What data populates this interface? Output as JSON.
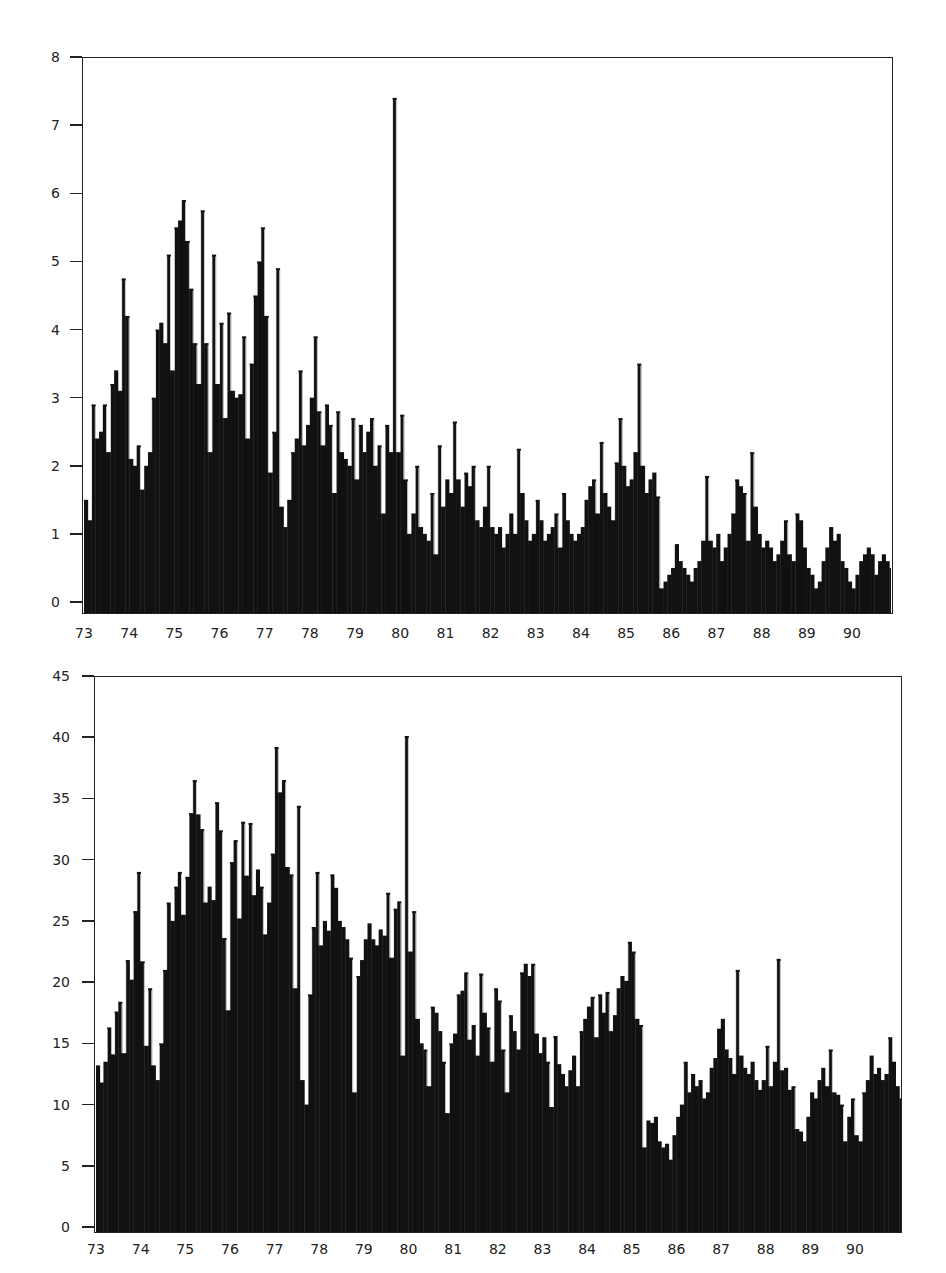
{
  "chart_data": [
    {
      "type": "bar",
      "title": "",
      "xlabel": "",
      "ylabel": "",
      "ylim": [
        0,
        8
      ],
      "xlim": [
        73,
        90.9
      ],
      "yticks": [
        "0",
        "1",
        "2",
        "3",
        "4",
        "5",
        "6",
        "7",
        "8"
      ],
      "xticks": [
        "73",
        "74",
        "75",
        "76",
        "77",
        "78",
        "79",
        "80",
        "81",
        "82",
        "83",
        "84",
        "85",
        "86",
        "87",
        "88",
        "89",
        "90"
      ],
      "grid": false,
      "legend": null,
      "bar_color": "#111111",
      "x_start": 73.0,
      "x_step": 0.0833,
      "values": [
        1.5,
        1.2,
        2.9,
        2.4,
        2.5,
        2.9,
        2.2,
        3.2,
        3.4,
        3.1,
        4.75,
        4.2,
        2.1,
        2.0,
        2.3,
        1.65,
        2.0,
        2.2,
        3.0,
        4.0,
        4.1,
        3.8,
        5.1,
        3.4,
        5.5,
        5.6,
        5.9,
        5.3,
        4.6,
        3.8,
        3.2,
        5.75,
        3.8,
        2.2,
        5.1,
        3.2,
        4.1,
        2.7,
        4.25,
        3.1,
        3.0,
        3.05,
        3.9,
        2.4,
        3.5,
        4.5,
        5.0,
        5.5,
        4.2,
        1.9,
        2.5,
        4.9,
        1.4,
        1.1,
        1.5,
        2.2,
        2.4,
        3.4,
        2.3,
        2.6,
        3.0,
        3.9,
        2.8,
        2.3,
        2.9,
        2.6,
        1.6,
        2.8,
        2.2,
        2.1,
        2.0,
        2.7,
        1.8,
        2.6,
        2.2,
        2.5,
        2.7,
        2.0,
        2.3,
        1.3,
        2.6,
        2.2,
        7.4,
        2.2,
        2.75,
        1.8,
        1.0,
        1.3,
        2.0,
        1.1,
        1.0,
        0.9,
        1.6,
        0.7,
        2.3,
        1.4,
        1.8,
        1.6,
        2.65,
        1.8,
        1.4,
        1.9,
        1.7,
        2.0,
        1.2,
        1.1,
        1.4,
        2.0,
        1.1,
        1.0,
        1.1,
        0.8,
        1.0,
        1.3,
        1.0,
        2.25,
        1.6,
        1.2,
        0.9,
        1.0,
        1.5,
        1.2,
        0.9,
        1.0,
        1.1,
        1.3,
        0.8,
        1.6,
        1.2,
        1.0,
        0.9,
        1.0,
        1.1,
        1.5,
        1.7,
        1.8,
        1.3,
        2.35,
        1.6,
        1.4,
        1.2,
        2.05,
        2.7,
        2.0,
        1.7,
        1.8,
        2.2,
        3.5,
        2.0,
        1.6,
        1.8,
        1.9,
        1.55,
        0.2,
        0.3,
        0.4,
        0.5,
        0.85,
        0.6,
        0.5,
        0.4,
        0.3,
        0.5,
        0.6,
        0.9,
        1.85,
        0.9,
        0.8,
        1.0,
        0.6,
        0.8,
        1.0,
        1.3,
        1.8,
        1.7,
        1.6,
        0.9,
        2.2,
        1.4,
        1.0,
        0.8,
        0.9,
        0.8,
        0.6,
        0.7,
        0.9,
        1.2,
        0.7,
        0.6,
        1.3,
        1.2,
        0.8,
        0.5,
        0.4,
        0.2,
        0.3,
        0.6,
        0.8,
        1.1,
        0.9,
        1.0,
        0.6,
        0.5,
        0.3,
        0.2,
        0.4,
        0.6,
        0.7,
        0.8,
        0.7,
        0.4,
        0.6,
        0.7,
        0.6,
        0.5,
        1.1,
        0.9,
        0.8,
        1.0,
        1.3,
        1.2,
        1.5,
        1.6,
        1.4,
        1.7,
        2.1,
        1.3,
        1.5,
        0.5,
        3.65,
        1.3,
        1.1,
        0.7,
        1.4,
        1.6,
        0.9,
        2.4,
        1.0,
        0.9,
        1.6,
        1.1,
        1.0,
        2.85,
        0.5,
        1.2,
        1.7,
        1.5,
        1.4,
        1.2,
        1.9,
        1.3,
        1.5,
        1.4,
        2.3,
        2.0,
        2.1,
        1.8,
        4.6,
        1.2
      ]
    },
    {
      "type": "bar",
      "title": "",
      "xlabel": "",
      "ylabel": "",
      "ylim": [
        0,
        45
      ],
      "xlim": [
        73,
        91.0
      ],
      "yticks": [
        "0",
        "5",
        "10",
        "15",
        "20",
        "25",
        "30",
        "35",
        "40",
        "45"
      ],
      "xticks": [
        "73",
        "74",
        "75",
        "76",
        "77",
        "78",
        "79",
        "80",
        "81",
        "82",
        "83",
        "84",
        "85",
        "86",
        "87",
        "88",
        "89",
        "90"
      ],
      "grid": false,
      "legend": null,
      "bar_color": "#111111",
      "x_start": 73.0,
      "x_step": 0.0833,
      "values": [
        13.2,
        11.8,
        13.5,
        16.3,
        14.1,
        17.6,
        18.4,
        14.2,
        21.8,
        20.2,
        25.8,
        29.0,
        21.7,
        14.8,
        19.5,
        13.2,
        12.0,
        15.0,
        21.0,
        26.5,
        25.0,
        27.8,
        29.0,
        25.5,
        28.6,
        33.8,
        36.5,
        33.7,
        32.5,
        26.5,
        27.8,
        26.7,
        34.7,
        32.4,
        23.6,
        17.7,
        29.8,
        31.6,
        25.2,
        33.1,
        28.7,
        33.0,
        27.1,
        29.2,
        27.8,
        23.9,
        26.5,
        30.5,
        39.2,
        35.5,
        36.5,
        29.4,
        28.8,
        19.5,
        34.4,
        12.0,
        10.0,
        19.0,
        24.5,
        29.0,
        23.0,
        25.0,
        24.2,
        28.8,
        27.7,
        25.0,
        24.5,
        23.5,
        22.0,
        11.0,
        20.5,
        21.8,
        23.5,
        24.8,
        23.5,
        23.0,
        24.3,
        23.8,
        27.3,
        22.0,
        26.0,
        26.6,
        14.0,
        40.1,
        22.5,
        25.8,
        17.0,
        15.0,
        14.5,
        11.5,
        18.0,
        17.5,
        16.0,
        13.5,
        9.3,
        15.0,
        15.8,
        19.0,
        19.3,
        20.8,
        15.3,
        16.5,
        14.0,
        20.7,
        17.5,
        16.3,
        13.5,
        19.5,
        18.5,
        14.5,
        11.0,
        17.3,
        16.0,
        14.5,
        20.8,
        21.5,
        20.5,
        21.5,
        15.8,
        14.2,
        15.5,
        13.5,
        9.8,
        15.6,
        13.3,
        12.5,
        11.5,
        12.8,
        14.0,
        11.5,
        16.0,
        17.0,
        18.0,
        18.8,
        15.5,
        19.0,
        17.5,
        19.2,
        16.0,
        17.3,
        19.5,
        20.5,
        20.1,
        23.3,
        22.5,
        17.0,
        16.5,
        6.5,
        8.7,
        8.5,
        9.0,
        7.0,
        6.5,
        6.8,
        5.5,
        7.5,
        9.0,
        10.0,
        13.5,
        11.0,
        12.5,
        11.5,
        12.0,
        10.5,
        11.0,
        13.0,
        13.8,
        16.2,
        17.0,
        14.5,
        13.8,
        12.5,
        21.0,
        14.0,
        13.0,
        12.5,
        13.5,
        12.0,
        11.2,
        12.0,
        14.8,
        11.5,
        13.5,
        21.9,
        12.8,
        13.0,
        11.2,
        11.5,
        8.0,
        7.8,
        7.0,
        9.0,
        11.0,
        10.5,
        12.0,
        13.0,
        11.5,
        14.5,
        11.0,
        10.8,
        10.0,
        7.0,
        9.0,
        10.5,
        7.5,
        7.0,
        11.0,
        12.0,
        14.0,
        12.5,
        13.0,
        12.0,
        12.5,
        15.5,
        13.5,
        11.5,
        10.5,
        21.2,
        20.0,
        18.0,
        17.5,
        20.5,
        22.5,
        21.0,
        19.0,
        22.5,
        21.0,
        25.0,
        30.0,
        17.0,
        20.5,
        19.5,
        22.0,
        16.5,
        18.0,
        17.5,
        29.5,
        18.5,
        17.0,
        18.5,
        16.0,
        28.0,
        13.5,
        21.0,
        24.5,
        18.0,
        22.5,
        21.0,
        22.0,
        21.5,
        22.0,
        34.0,
        26.8,
        26.5,
        25.2,
        27.0,
        32.2,
        19.5
      ]
    }
  ],
  "header": {
    "corner_text": ""
  }
}
